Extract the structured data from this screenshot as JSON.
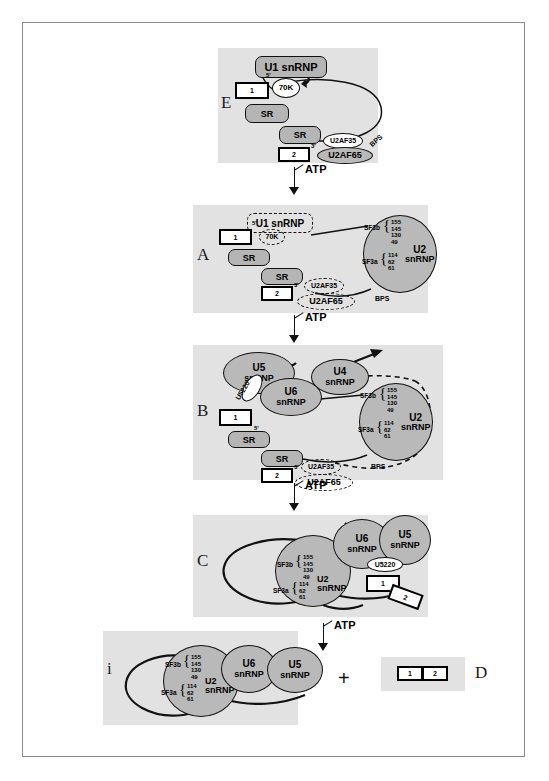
{
  "figure": {
    "caption_labels": {
      "E": "E",
      "A": "A",
      "B": "B",
      "C": "C",
      "i": "i",
      "D": "D"
    },
    "plus": "+",
    "atp_label": "ATP"
  },
  "components": {
    "u1_snrnp": "U1 snRNP",
    "u2_snrnp": "U2 snRNP",
    "u4_snrnp": "U4 snRNP",
    "u5_snrnp": "U5 snRNP",
    "u6_snrnp": "U6 snRNP",
    "seventyk": "70K",
    "sr": "SR",
    "u2af35": "U2AF35",
    "u2af65": "U2AF65",
    "u5220": "U5220",
    "bps": "BPS",
    "sf3b": "SF3b",
    "sf3a": "SF3a",
    "five_prime": "5'",
    "three_prime": "3'",
    "exon1": "1",
    "exon2": "2",
    "u2_line1": "U2",
    "u2_line2": "snRNP",
    "u4_line1": "U4",
    "u4_line2": "snRNP",
    "u5_line1": "U5",
    "u5_line2": "snRNP",
    "u6_line1": "U6",
    "u6_line2": "snRNP"
  },
  "sf3b_subunits": [
    "155",
    "145",
    "130",
    "49"
  ],
  "sf3a_subunits": [
    "114",
    "62",
    "61"
  ],
  "stages": [
    {
      "id": "E",
      "label": "E"
    },
    {
      "id": "A",
      "label": "A"
    },
    {
      "id": "B",
      "label": "B"
    },
    {
      "id": "C",
      "label": "C"
    },
    {
      "id": "i",
      "label": "i"
    },
    {
      "id": "D",
      "label": "D"
    }
  ],
  "transitions": [
    {
      "from": "E",
      "to": "A",
      "label": "ATP"
    },
    {
      "from": "A",
      "to": "B",
      "label": "ATP"
    },
    {
      "from": "B",
      "to": "C",
      "label": "ATP"
    },
    {
      "from": "C",
      "to": "i",
      "label": "ATP"
    }
  ],
  "colors": {
    "panel_background": "#e2e2e2",
    "shape_gray": "#b9b9b9",
    "shape_white": "#ffffff",
    "stroke": "#111111",
    "frame_border": "#8c8c8c"
  }
}
